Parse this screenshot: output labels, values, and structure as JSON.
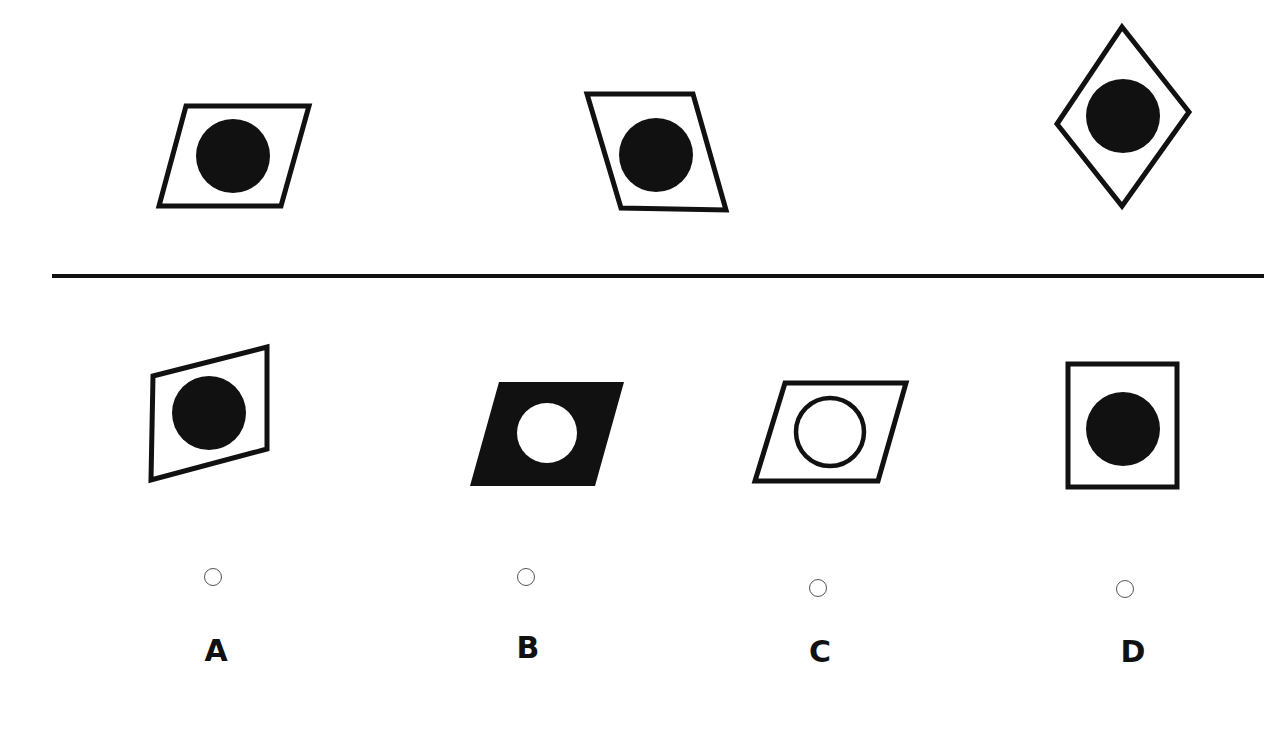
{
  "puzzle": {
    "type": "figure-reasoning",
    "question_figures": [
      {
        "id": "q1",
        "shape": "parallelogram-lean-right",
        "frame_fill": "white",
        "circle": "filled-black"
      },
      {
        "id": "q2",
        "shape": "parallelogram-lean-left",
        "frame_fill": "white",
        "circle": "filled-black"
      },
      {
        "id": "q3",
        "shape": "diamond",
        "frame_fill": "white",
        "circle": "filled-black"
      }
    ],
    "options": [
      {
        "letter": "A",
        "shape": "skewed-quadrilateral",
        "frame_fill": "white",
        "circle": "filled-black",
        "selected": false
      },
      {
        "letter": "B",
        "shape": "parallelogram-lean-right",
        "frame_fill": "black",
        "circle": "white",
        "selected": false
      },
      {
        "letter": "C",
        "shape": "parallelogram-lean-right",
        "frame_fill": "white",
        "circle": "hollow-ring",
        "selected": false
      },
      {
        "letter": "D",
        "shape": "rectangle",
        "frame_fill": "white",
        "circle": "filled-black",
        "selected": false
      }
    ]
  },
  "colors": {
    "ink": "#111111",
    "background": "#ffffff",
    "radio_border": "#555555"
  }
}
